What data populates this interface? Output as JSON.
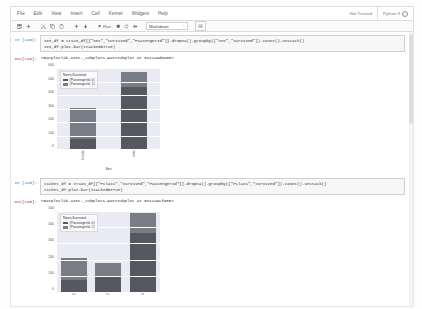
{
  "window": {
    "title": "Jupyter Notebook"
  },
  "menu": {
    "items": [
      {
        "label": "File",
        "name": "menu-file"
      },
      {
        "label": "Edit",
        "name": "menu-edit"
      },
      {
        "label": "View",
        "name": "menu-view"
      },
      {
        "label": "Insert",
        "name": "menu-insert"
      },
      {
        "label": "Cell",
        "name": "menu-cell"
      },
      {
        "label": "Kernel",
        "name": "menu-kernel"
      },
      {
        "label": "Widgets",
        "name": "menu-widgets"
      },
      {
        "label": "Help",
        "name": "menu-help"
      }
    ],
    "trust_status": "Not Trusted",
    "kernel_name": "Python 3"
  },
  "toolbar": {
    "save_icon": "ὋE",
    "buttons": [
      {
        "name": "save-button",
        "glyph": "▣"
      },
      {
        "name": "add-cell-button",
        "glyph": "+"
      },
      {
        "name": "cut-cell-button",
        "glyph": "✂"
      },
      {
        "name": "copy-cell-button",
        "glyph": "⧉"
      },
      {
        "name": "paste-cell-button",
        "glyph": "ὌB"
      },
      {
        "name": "move-cell-up-button",
        "glyph": "↑"
      },
      {
        "name": "move-cell-down-button",
        "glyph": "↓"
      }
    ],
    "run_label": "Run",
    "run_glyph": "▶",
    "stop_glyph": "■",
    "restart_glyph": "C",
    "restart_run_all_glyph": "↠",
    "celltype_value": "Markdown",
    "celltype_caret": "↕",
    "command_palette_glyph": "⌨"
  },
  "cells": [
    {
      "prompt_in": "In [146]:",
      "prompt_out": "Out[146]:",
      "code_lines": [
        "sex_df = train_df[[\"Sex\",\"Survived\",\"PassengerId\"]].dropna().groupby([\"Sex\",\"Survived\"]).count().unstack()",
        "sex_df.plot.bar(stacked=True)"
      ],
      "output_text": "<matplotlib.axes._subplots.AxesSubplot at 0x11a9d8a50>",
      "chart_index": 0
    },
    {
      "prompt_in": "In [145]:",
      "prompt_out": "Out[145]:",
      "code_lines": [
        "ticket_df = train_df[[\"Pclass\",\"Survived\",\"PassengerId\"]].dropna().groupby([\"Pclass\",\"Survived\"]).count().unstack()",
        "ticket_df.plot.bar(stacked=True)"
      ],
      "output_text": "<matplotlib.axes._subplots.AxesSubplot at 0x11a9cf950>",
      "chart_index": 1
    }
  ],
  "colors": {
    "series_0": "#55585e",
    "series_1": "#787c84",
    "plot_background": "#eaeaf2",
    "grid": "#ffffff"
  },
  "chart_data": [
    {
      "type": "bar",
      "stacked": true,
      "title": "",
      "xlabel": "Sex",
      "ylabel": "",
      "categories": [
        "female",
        "male"
      ],
      "series": [
        {
          "name": "(PassengerId, 0)",
          "values": [
            81,
            468
          ]
        },
        {
          "name": "(PassengerId, 1)",
          "values": [
            233,
            109
          ]
        }
      ],
      "legend_title": "None,Survived",
      "legend_position": "upper left",
      "ylim": [
        0,
        600
      ],
      "yticks": [
        0,
        100,
        200,
        300,
        400,
        500,
        600
      ],
      "grid": true
    },
    {
      "type": "bar",
      "stacked": true,
      "title": "",
      "xlabel": "Pclass",
      "ylabel": "",
      "categories": [
        "1",
        "2",
        "3"
      ],
      "series": [
        {
          "name": "(PassengerId, 0)",
          "values": [
            80,
            97,
            372
          ]
        },
        {
          "name": "(PassengerId, 1)",
          "values": [
            136,
            87,
            119
          ]
        }
      ],
      "legend_title": "None,Survived",
      "legend_position": "upper left",
      "ylim": [
        0,
        500
      ],
      "yticks": [
        0,
        100,
        200,
        300,
        400,
        500
      ],
      "grid": true
    }
  ]
}
